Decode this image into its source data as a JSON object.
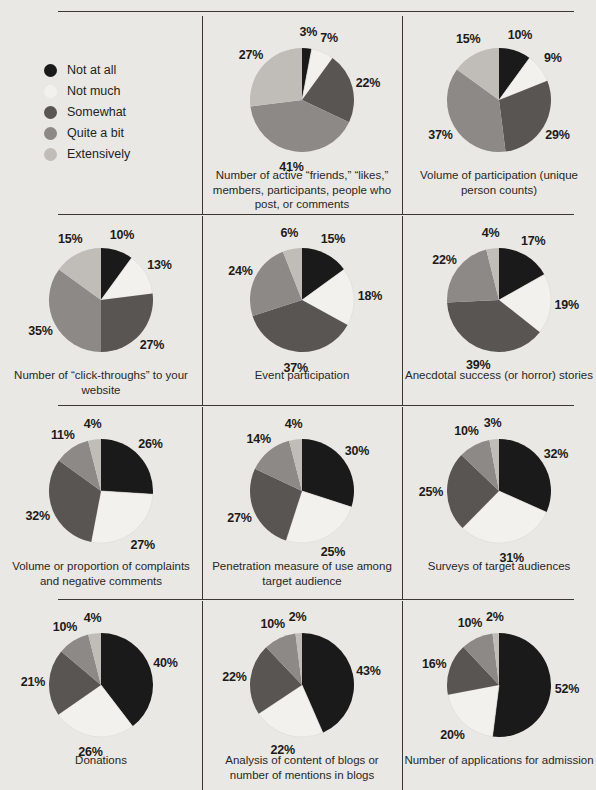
{
  "page": {
    "background_color": "#e9e8e4",
    "text_color": "#221f1d",
    "rule_color": "#3a3734"
  },
  "legend": {
    "title": "",
    "items": [
      {
        "label": "Not at all",
        "color": "#1a1a1a"
      },
      {
        "label": "Not much",
        "color": "#f2f1ee"
      },
      {
        "label": "Somewhat",
        "color": "#585552"
      },
      {
        "label": "Quite a bit",
        "color": "#8c8986"
      },
      {
        "label": "Extensively",
        "color": "#c0bdb8"
      }
    ]
  },
  "chart_data": [
    {
      "type": "pie",
      "title": "Number of active “friends,” “likes,” members, participants, people who post, or comments",
      "categories": [
        "Not at all",
        "Not much",
        "Somewhat",
        "Quite a bit",
        "Extensively"
      ],
      "values": [
        3,
        7,
        22,
        41,
        27
      ],
      "labels": [
        "3%",
        "7%",
        "22%",
        "41%",
        "27%"
      ],
      "colors": [
        "#1a1a1a",
        "#f2f1ee",
        "#585552",
        "#8c8986",
        "#c0bdb8"
      ]
    },
    {
      "type": "pie",
      "title": "Volume of participation (unique person counts)",
      "categories": [
        "Not at all",
        "Not much",
        "Somewhat",
        "Quite a bit",
        "Extensively"
      ],
      "values": [
        10,
        9,
        29,
        37,
        15
      ],
      "labels": [
        "10%",
        "9%",
        "29%",
        "37%",
        "15%"
      ],
      "colors": [
        "#1a1a1a",
        "#f2f1ee",
        "#585552",
        "#8c8986",
        "#c0bdb8"
      ]
    },
    {
      "type": "pie",
      "title": "Number of “click-throughs” to your website",
      "categories": [
        "Not at all",
        "Not much",
        "Somewhat",
        "Quite a bit",
        "Extensively"
      ],
      "values": [
        10,
        13,
        27,
        35,
        15
      ],
      "labels": [
        "10%",
        "13%",
        "27%",
        "35%",
        "15%"
      ],
      "colors": [
        "#1a1a1a",
        "#f2f1ee",
        "#585552",
        "#8c8986",
        "#c0bdb8"
      ]
    },
    {
      "type": "pie",
      "title": "Event participation",
      "categories": [
        "Not at all",
        "Not much",
        "Somewhat",
        "Quite a bit",
        "Extensively"
      ],
      "values": [
        15,
        18,
        37,
        24,
        6
      ],
      "labels": [
        "15%",
        "18%",
        "37%",
        "24%",
        "6%"
      ],
      "colors": [
        "#1a1a1a",
        "#f2f1ee",
        "#585552",
        "#8c8986",
        "#c0bdb8"
      ]
    },
    {
      "type": "pie",
      "title": "Anecdotal success (or horror) stories",
      "categories": [
        "Not at all",
        "Not much",
        "Somewhat",
        "Quite a bit",
        "Extensively"
      ],
      "values": [
        17,
        19,
        39,
        22,
        4
      ],
      "labels": [
        "17%",
        "19%",
        "39%",
        "22%",
        "4%"
      ],
      "colors": [
        "#1a1a1a",
        "#f2f1ee",
        "#585552",
        "#8c8986",
        "#c0bdb8"
      ]
    },
    {
      "type": "pie",
      "title": "Volume or proportion of complaints and negative comments",
      "categories": [
        "Not at all",
        "Not much",
        "Somewhat",
        "Quite a bit",
        "Extensively"
      ],
      "values": [
        26,
        27,
        32,
        11,
        4
      ],
      "labels": [
        "26%",
        "27%",
        "32%",
        "11%",
        "4%"
      ],
      "colors": [
        "#1a1a1a",
        "#f2f1ee",
        "#585552",
        "#8c8986",
        "#c0bdb8"
      ]
    },
    {
      "type": "pie",
      "title": "Penetration measure of use among target audience",
      "categories": [
        "Not at all",
        "Not much",
        "Somewhat",
        "Quite a bit",
        "Extensively"
      ],
      "values": [
        30,
        25,
        27,
        14,
        4
      ],
      "labels": [
        "30%",
        "25%",
        "27%",
        "14%",
        "4%"
      ],
      "colors": [
        "#1a1a1a",
        "#f2f1ee",
        "#585552",
        "#8c8986",
        "#c0bdb8"
      ]
    },
    {
      "type": "pie",
      "title": "Surveys of target audiences",
      "categories": [
        "Not at all",
        "Not much",
        "Somewhat",
        "Quite a bit",
        "Extensively"
      ],
      "values": [
        32,
        31,
        25,
        10,
        3
      ],
      "labels": [
        "32%",
        "31%",
        "25%",
        "10%",
        "3%"
      ],
      "colors": [
        "#1a1a1a",
        "#f2f1ee",
        "#585552",
        "#8c8986",
        "#c0bdb8"
      ]
    },
    {
      "type": "pie",
      "title": "Donations",
      "categories": [
        "Not at all",
        "Not much",
        "Somewhat",
        "Quite a bit",
        "Extensively"
      ],
      "values": [
        40,
        26,
        21,
        10,
        4
      ],
      "labels": [
        "40%",
        "26%",
        "21%",
        "10%",
        "4%"
      ],
      "colors": [
        "#1a1a1a",
        "#f2f1ee",
        "#585552",
        "#8c8986",
        "#c0bdb8"
      ]
    },
    {
      "type": "pie",
      "title": "Analysis of content of blogs or number of mentions in blogs",
      "categories": [
        "Not at all",
        "Not much",
        "Somewhat",
        "Quite a bit",
        "Extensively"
      ],
      "values": [
        43,
        22,
        22,
        10,
        2
      ],
      "labels": [
        "43%",
        "22%",
        "22%",
        "10%",
        "2%"
      ],
      "colors": [
        "#1a1a1a",
        "#f2f1ee",
        "#585552",
        "#8c8986",
        "#c0bdb8"
      ]
    },
    {
      "type": "pie",
      "title": "Number of applications for admission",
      "categories": [
        "Not at all",
        "Not much",
        "Somewhat",
        "Quite a bit",
        "Extensively"
      ],
      "values": [
        52,
        20,
        16,
        10,
        2
      ],
      "labels": [
        "52%",
        "20%",
        "16%",
        "10%",
        "2%"
      ],
      "colors": [
        "#1a1a1a",
        "#f2f1ee",
        "#585552",
        "#8c8986",
        "#c0bdb8"
      ]
    }
  ],
  "layout": {
    "columns": 3,
    "rows": 4,
    "legend_cell_index": 0
  }
}
